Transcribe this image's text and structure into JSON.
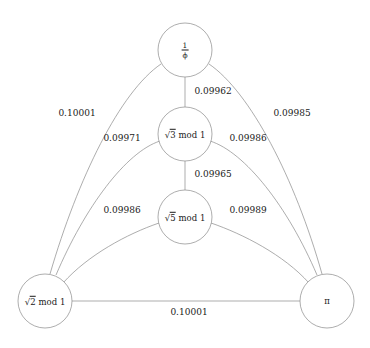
{
  "figure": {
    "type": "graph-diagram",
    "title": "",
    "background_color": "#ffffff",
    "stroke_color": "#8a8a8a",
    "text_color": "#1a1a1a",
    "width": 370,
    "height": 348
  },
  "nodes": [
    {
      "id": "inv_phi",
      "label": "1/ϕ",
      "numerator": "1",
      "denominator": "ϕ",
      "label_kind": "fraction",
      "cx": 185,
      "cy": 50,
      "r": 27
    },
    {
      "id": "sqrt3",
      "label": "√3 mod 1",
      "radicand": "3",
      "suffix": "mod 1",
      "label_kind": "sqrt",
      "cx": 185,
      "cy": 134,
      "r": 27
    },
    {
      "id": "sqrt5",
      "label": "√5 mod 1",
      "radicand": "5",
      "suffix": "mod 1",
      "label_kind": "sqrt",
      "cx": 185,
      "cy": 217,
      "r": 27
    },
    {
      "id": "sqrt2",
      "label": "√2 mod 1",
      "radicand": "2",
      "suffix": "mod 1",
      "label_kind": "sqrt",
      "cx": 45,
      "cy": 301,
      "r": 27
    },
    {
      "id": "pi",
      "label": "π",
      "label_kind": "plain",
      "cx": 327,
      "cy": 301,
      "r": 27
    }
  ],
  "edges": [
    {
      "id": "e_invphi_sqrt2",
      "source": "inv_phi",
      "target": "sqrt2",
      "weight": "0.10001",
      "label_x": 77,
      "label_y": 114,
      "path": "M 161,64 C 120,92 78,178 50,274"
    },
    {
      "id": "e_invphi_sqrt3",
      "source": "inv_phi",
      "target": "sqrt3",
      "weight": "0.09962",
      "label_x": 213,
      "label_y": 92,
      "path": "M 185,77 L 185,107"
    },
    {
      "id": "e_invphi_pi",
      "source": "inv_phi",
      "target": "pi",
      "weight": "0.09985",
      "label_x": 292,
      "label_y": 114,
      "path": "M 209,64 C 250,92 295,178 322,274"
    },
    {
      "id": "e_sqrt3_sqrt2",
      "source": "sqrt3",
      "target": "sqrt2",
      "weight": "0.09971",
      "label_x": 122,
      "label_y": 139,
      "path": "M 160,141 C 126,152 85,207 56,275"
    },
    {
      "id": "e_sqrt3_pi",
      "source": "sqrt3",
      "target": "pi",
      "weight": "0.09986",
      "label_x": 248,
      "label_y": 139,
      "path": "M 210,141 C 245,152 288,207 317,275"
    },
    {
      "id": "e_sqrt3_sqrt5",
      "source": "sqrt3",
      "target": "sqrt5",
      "weight": "0.09965",
      "label_x": 213,
      "label_y": 175,
      "path": "M 185,161 L 185,190"
    },
    {
      "id": "e_sqrt5_sqrt2",
      "source": "sqrt5",
      "target": "sqrt2",
      "weight": "0.09986",
      "label_x": 122,
      "label_y": 211,
      "path": "M 159,223 C 127,234 88,255 63,283"
    },
    {
      "id": "e_sqrt5_pi",
      "source": "sqrt5",
      "target": "pi",
      "weight": "0.09989",
      "label_x": 248,
      "label_y": 211,
      "path": "M 211,223 C 243,234 284,255 309,283"
    },
    {
      "id": "e_sqrt2_pi",
      "source": "sqrt2",
      "target": "pi",
      "weight": "0.10001",
      "label_x": 189,
      "label_y": 313,
      "path": "M 72,301 L 300,301"
    }
  ],
  "chart_data": {
    "type": "graph",
    "title": "",
    "node_count": 5,
    "edge_count": 9,
    "node_labels": [
      "1/ϕ",
      "√3 mod 1",
      "√5 mod 1",
      "√2 mod 1",
      "π"
    ],
    "edge_list": [
      {
        "from": "1/ϕ",
        "to": "√2 mod 1",
        "weight": 0.10001
      },
      {
        "from": "1/ϕ",
        "to": "√3 mod 1",
        "weight": 0.09962
      },
      {
        "from": "1/ϕ",
        "to": "π",
        "weight": 0.09985
      },
      {
        "from": "√3 mod 1",
        "to": "√2 mod 1",
        "weight": 0.09971
      },
      {
        "from": "√3 mod 1",
        "to": "π",
        "weight": 0.09986
      },
      {
        "from": "√3 mod 1",
        "to": "√5 mod 1",
        "weight": 0.09965
      },
      {
        "from": "√5 mod 1",
        "to": "√2 mod 1",
        "weight": 0.09986
      },
      {
        "from": "√5 mod 1",
        "to": "π",
        "weight": 0.09989
      },
      {
        "from": "√2 mod 1",
        "to": "π",
        "weight": 0.10001
      }
    ]
  }
}
